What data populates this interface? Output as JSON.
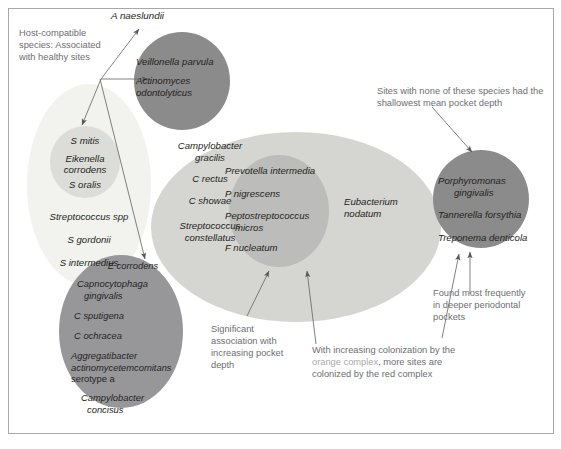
{
  "figure": {
    "type": "socransky-microbial-complex-diagram",
    "background": "#ffffff",
    "frame_border_color": "#a8a8a8"
  },
  "annotations": {
    "host_compatible": "Host-compatible\nspecies: Associated\nwith healthy sites",
    "shallowest": "Sites with none of these species had the\nshallowest mean pocket depth",
    "significant": "Significant\nassociation with\nincreasing pocket\ndepth",
    "increasing_colonization_pre": "With increasing colonization by the",
    "increasing_colonization_hl": "orange complex",
    "increasing_colonization_post": ", more sites are",
    "increasing_colonization_line3": "colonized by the red complex",
    "found_most": "Found most frequently\nin deeper periodontal\npockets"
  },
  "free_label": {
    "a_naeslundii": "A naeslundii"
  },
  "complexes": [
    {
      "id": "yellow-complex",
      "name": "yellow-complex",
      "color": "#f2f2ef",
      "species": [
        "Streptococcus spp",
        "S gordonii",
        "S intermedius"
      ]
    },
    {
      "id": "yellow-inner",
      "name": "yellow-inner-core",
      "color": "#dcdcd8",
      "species": [
        "S mitis",
        "Eikenella\ncorrodens",
        "S oralis"
      ]
    },
    {
      "id": "purple-complex",
      "name": "purple-complex",
      "color": "#8b8b8b",
      "species": [
        "Veillonella parvula",
        "Actinomyces\nodontolyticus"
      ]
    },
    {
      "id": "green-complex",
      "name": "green-complex",
      "color": "#97979a",
      "species": [
        "E corrodens",
        "Capnocytophaga\ngingivalis",
        "C sputigena",
        "C ochracea",
        "Aggregatibacter\nactinomycetemcomitans\nserotype a",
        "Campylobacter\nconcisus"
      ]
    },
    {
      "id": "orange-complex",
      "name": "orange-complex",
      "color": "#d5d5d2",
      "species": [
        "Campylobacter\ngracilis",
        "C rectus",
        "C showae",
        "Streptococcus\nconstellatus",
        "Eubacterium\nnodatum"
      ]
    },
    {
      "id": "orange-inner",
      "name": "orange-inner-core",
      "color": "#bcbcba",
      "species": [
        "Prevotella intermedia",
        "P nigrescens",
        "Peptostreptococcus\nmicros",
        "F nucleatum"
      ]
    },
    {
      "id": "red-complex",
      "name": "red-complex",
      "color": "#8b8b8b",
      "species": [
        "Porphyromonas\ngingivalis",
        "Tannerella forsythia",
        "Treponema denticola"
      ]
    }
  ],
  "species_text": {
    "yellow_outer_1": "Streptococcus spp",
    "yellow_outer_2": "S gordonii",
    "yellow_outer_3": "S intermedius",
    "yellow_inner_1": "S mitis",
    "yellow_inner_2a": "Eikenella",
    "yellow_inner_2b": "corrodens",
    "yellow_inner_3": "S oralis",
    "purple_1": "Veillonella parvula",
    "purple_2a": "Actinomyces",
    "purple_2b": "odontolyticus",
    "green_1": "E corrodens",
    "green_2a": "Capnocytophaga",
    "green_2b": "gingivalis",
    "green_3": "C sputigena",
    "green_4": "C ochracea",
    "green_5a": "Aggregatibacter",
    "green_5b": "actinomycetemcomitans",
    "green_5c": "serotype a",
    "green_6a": "Campylobacter",
    "green_6b": "concisus",
    "orange_1a": "Campylobacter",
    "orange_1b": "gracilis",
    "orange_2": "C rectus",
    "orange_3": "C showae",
    "orange_4a": "Streptococcus",
    "orange_4b": "constellatus",
    "orange_5a": "Eubacterium",
    "orange_5b": "nodatum",
    "orange_inner_1": "Prevotella intermedia",
    "orange_inner_2": "P nigrescens",
    "orange_inner_3a": "Peptostreptococcus",
    "orange_inner_3b": "micros",
    "orange_inner_4": "F nucleatum",
    "red_1a": "Porphyromonas",
    "red_1b": "gingivalis",
    "red_2": "Tannerella forsythia",
    "red_3": "Treponema denticola"
  }
}
